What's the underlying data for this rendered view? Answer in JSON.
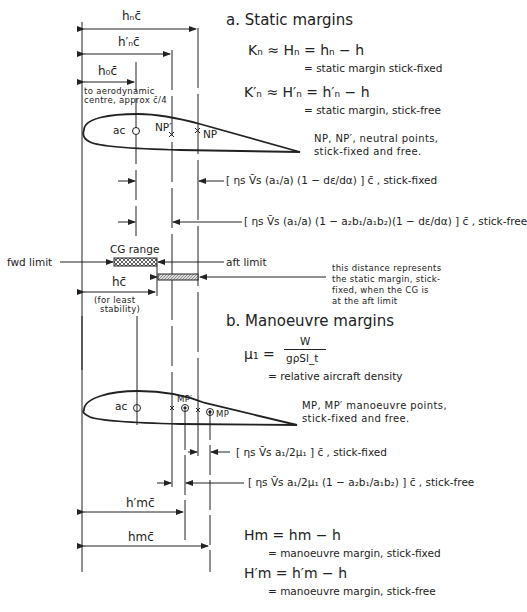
{
  "section_a": {
    "title": "a.  Static margins",
    "eq1": "Kₙ ≈ Hₙ = hₙ − h",
    "eq1_desc": "= static margin stick-fixed",
    "eq2": "K′ₙ ≈ H′ₙ = h′ₙ − h",
    "eq2_desc": "= static margin, stick-free",
    "np_note_1": "NP, NP′, neutral points,",
    "np_note_2": "stick-fixed and free.",
    "formula_fixed": "[ ηs V̄s (a₁/a) (1 − dε/dα) ] c̄ ,  stick-fixed",
    "formula_free": "[ ηs V̄s (a₁/a) (1 − a₂b₁/a₁b₂)(1 − dε/dα) ] c̄ ,  stick-free",
    "dim_hn": "hₙc̄",
    "dim_hn_prime": "h′ₙc̄",
    "dim_h0": "h₀c̄",
    "ac_note_1": "to aerodynamic",
    "ac_note_2": "centre, approx c̄/4",
    "label_ac": "ac",
    "label_np_prime": "NP′",
    "label_np": "NP",
    "cg_range": "CG range",
    "fwd_limit": "fwd limit",
    "aft_limit": "aft limit",
    "dim_h": "hc̄",
    "least_stab_1": "(for least",
    "least_stab_2": "stability)",
    "distance_note": [
      "this distance represents",
      "the static margin, stick-",
      "fixed, when the CG is",
      "at the aft limit"
    ]
  },
  "section_b": {
    "title": "b.  Manoeuvre margins",
    "mu_lhs": "μ₁ =",
    "mu_num": "W",
    "mu_den": "gρSl_t",
    "mu_desc": "= relative aircraft density",
    "mp_note_1": "MP, MP′ manoeuvre points,",
    "mp_note_2": "stick-fixed and free.",
    "formula_fixed": "[ ηs V̄s a₁/2μ₁ ] c̄ ,  stick-fixed",
    "formula_free": "[ ηs V̄s a₁/2μ₁ (1 − a₂b₁/a₁b₂) ] c̄ , stick-free",
    "label_ac": "ac",
    "label_mp_prime": "MP′",
    "label_mp": "MP",
    "dim_hm_prime": "h′mc̄",
    "dim_hm": "hmc̄",
    "eq3": "Hm = hm − h",
    "eq3_desc": "= manoeuvre margin, stick-fixed",
    "eq4": "H′m = h′m − h",
    "eq4_desc": "= manoeuvre margin, stick-free"
  }
}
